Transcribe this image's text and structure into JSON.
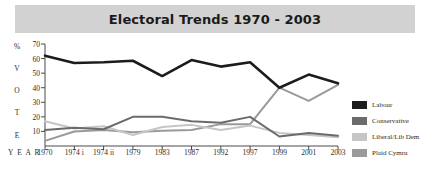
{
  "title": "Electoral Trends 1970 - 2003",
  "axes": {
    "yaxis_title_chars": [
      "%",
      "V",
      "O",
      "T",
      "E"
    ],
    "xaxis_title": "Y E A R",
    "yticks": [
      "70",
      "60",
      "50",
      "40",
      "30",
      "20",
      "10"
    ],
    "xticks": [
      "1970",
      "1974 i",
      "1974 ii",
      "1979",
      "1983",
      "1987",
      "1992",
      "1997",
      "1999",
      "2001",
      "2003"
    ]
  },
  "legend": {
    "items": [
      {
        "label": "Labour",
        "color": "#1c1c1c"
      },
      {
        "label": "Conservative",
        "color": "#6b6b6b"
      },
      {
        "label": "Liberal/Lib Dem",
        "color": "#c6c6c6"
      },
      {
        "label": "Plaid Cymru",
        "color": "#9a9a9a"
      }
    ]
  },
  "chart_data": {
    "type": "line",
    "title": "Electoral Trends 1970 - 2003",
    "xlabel": "YEAR",
    "ylabel": "% VOTE",
    "ylim": [
      0,
      70
    ],
    "yticks": [
      10,
      20,
      30,
      40,
      50,
      60,
      70
    ],
    "grid": false,
    "legend_position": "right",
    "categories": [
      "1970",
      "1974 i",
      "1974 ii",
      "1979",
      "1983",
      "1987",
      "1992",
      "1997",
      "1999",
      "2001",
      "2003"
    ],
    "series": [
      {
        "name": "Labour",
        "color": "#1c1c1c",
        "values": [
          62,
          57,
          57.5,
          58.5,
          48,
          59,
          54.5,
          57.5,
          40,
          49,
          43
        ]
      },
      {
        "name": "Conservative",
        "color": "#6b6b6b",
        "values": [
          11,
          12.5,
          11.5,
          20,
          20,
          17,
          16,
          20,
          6.5,
          9,
          7
        ]
      },
      {
        "name": "Liberal/Lib Dem",
        "color": "#c6c6c6",
        "values": [
          17,
          12,
          13.5,
          7.5,
          13,
          14.5,
          11,
          14,
          9,
          7.5,
          6
        ]
      },
      {
        "name": "Plaid Cymru",
        "color": "#9a9a9a",
        "values": [
          3.5,
          10,
          11,
          9.5,
          10.5,
          11,
          15,
          15,
          40,
          31,
          42
        ]
      }
    ]
  },
  "colors": {
    "title_band": "#d2d2d2",
    "axis": "#4a4a4a",
    "text": "#2b2b2b",
    "background": "#ffffff"
  }
}
